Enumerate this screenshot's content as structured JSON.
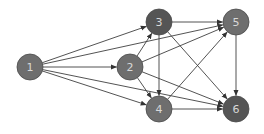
{
  "diagram": {
    "type": "directed-graph",
    "nodes": [
      {
        "id": "1",
        "label": "1",
        "x": 30,
        "y": 67,
        "color": "#6e6e6e"
      },
      {
        "id": "2",
        "label": "2",
        "x": 130,
        "y": 67,
        "color": "#6e6e6e"
      },
      {
        "id": "3",
        "label": "3",
        "x": 159,
        "y": 22,
        "color": "#555555"
      },
      {
        "id": "4",
        "label": "4",
        "x": 159,
        "y": 109,
        "color": "#6e6e6e"
      },
      {
        "id": "5",
        "label": "5",
        "x": 236,
        "y": 22,
        "color": "#6e6e6e"
      },
      {
        "id": "6",
        "label": "6",
        "x": 236,
        "y": 109,
        "color": "#555555"
      }
    ],
    "edges": [
      {
        "from": "1",
        "to": "3"
      },
      {
        "from": "1",
        "to": "5"
      },
      {
        "from": "1",
        "to": "2"
      },
      {
        "from": "1",
        "to": "6"
      },
      {
        "from": "1",
        "to": "4"
      },
      {
        "from": "2",
        "to": "3"
      },
      {
        "from": "2",
        "to": "5"
      },
      {
        "from": "2",
        "to": "4"
      },
      {
        "from": "2",
        "to": "6"
      },
      {
        "from": "3",
        "to": "5"
      },
      {
        "from": "3",
        "to": "4"
      },
      {
        "from": "3",
        "to": "6"
      },
      {
        "from": "4",
        "to": "5"
      },
      {
        "from": "4",
        "to": "6"
      },
      {
        "from": "5",
        "to": "6"
      }
    ],
    "node_radius": 13,
    "edge_color": "#404040",
    "node_stroke": "#4a4a4a",
    "label_color": "#d8d8d8"
  }
}
